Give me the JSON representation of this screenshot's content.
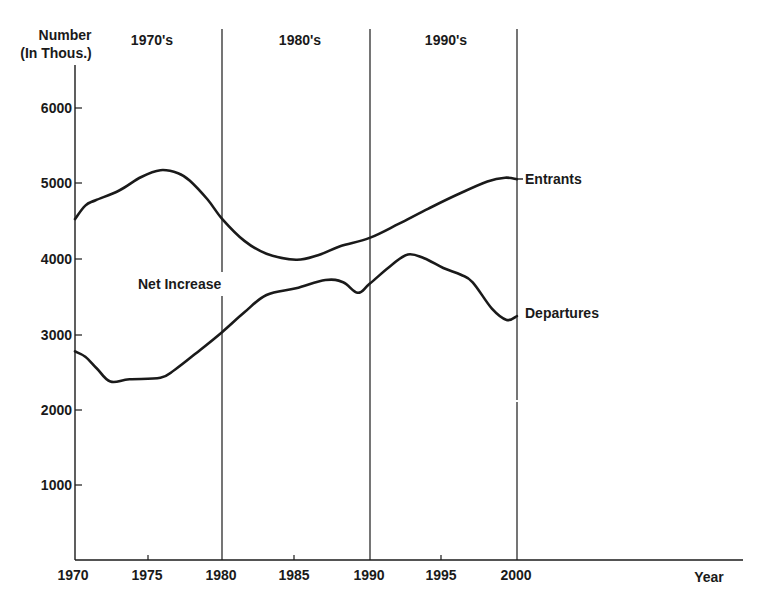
{
  "chart_data": {
    "type": "line",
    "title": "",
    "xlabel": "Year",
    "ylabel": "Number (In Thous.)",
    "ylabel_lines": [
      "Number",
      "(In Thous.)"
    ],
    "xlim": [
      1970,
      2000
    ],
    "ylim": [
      0,
      6000
    ],
    "x_ticks": [
      1970,
      1975,
      1980,
      1985,
      1990,
      1995,
      2000
    ],
    "y_ticks": [
      1000,
      2000,
      3000,
      4000,
      5000,
      6000
    ],
    "grid": false,
    "legend": "inline labels at right end of series",
    "decade_bands": [
      {
        "label": "1970's",
        "start": 1970,
        "end": 1980
      },
      {
        "label": "1980's",
        "start": 1980,
        "end": 1990
      },
      {
        "label": "1990's",
        "start": 1990,
        "end": 2000
      }
    ],
    "annotations": [
      {
        "text": "Net Increase",
        "x": 1977.5,
        "y": 3700,
        "note": "region between Entrants and Departures"
      }
    ],
    "series": [
      {
        "name": "Entrants",
        "x": [
          1970,
          1970.7,
          1971.4,
          1973,
          1974.5,
          1975.8,
          1977,
          1977.8,
          1979,
          1980,
          1981.5,
          1983,
          1985,
          1986.5,
          1988,
          1990,
          1992,
          1994,
          1996,
          1998,
          1999.2,
          2000
        ],
        "values": [
          4540,
          4720,
          4790,
          4920,
          5100,
          5190,
          5150,
          5050,
          4800,
          4540,
          4250,
          4080,
          4000,
          4060,
          4180,
          4290,
          4480,
          4680,
          4870,
          5040,
          5090,
          5070
        ]
      },
      {
        "name": "Departures",
        "x": [
          1970,
          1970.7,
          1971.5,
          1972.4,
          1973.7,
          1975.8,
          1976.8,
          1978.5,
          1980,
          1981.5,
          1983,
          1985,
          1987,
          1988.2,
          1989.2,
          1990,
          1991.5,
          1992.6,
          1993.7,
          1995,
          1996.2,
          1997,
          1998.3,
          1999.3,
          2000
        ],
        "values": [
          2780,
          2710,
          2550,
          2380,
          2410,
          2430,
          2540,
          2800,
          3040,
          3300,
          3530,
          3620,
          3730,
          3700,
          3560,
          3680,
          3930,
          4070,
          4020,
          3890,
          3800,
          3700,
          3350,
          3200,
          3250
        ]
      }
    ]
  },
  "labels": {
    "y_title_line1": "Number",
    "y_title_line2": "(In Thous.)",
    "x_title": "Year",
    "decade_1": "1970's",
    "decade_2": "1980's",
    "decade_3": "1990's",
    "net_increase": "Net Increase",
    "entrants": "Entrants",
    "departures": "Departures",
    "yt_1000": "1000",
    "yt_2000": "2000",
    "yt_3000": "3000",
    "yt_4000": "4000",
    "yt_5000": "5000",
    "yt_6000": "6000",
    "xt_1970": "1970",
    "xt_1975": "1975",
    "xt_1980": "1980",
    "xt_1985": "1985",
    "xt_1990": "1990",
    "xt_1995": "1995",
    "xt_2000": "2000"
  },
  "colors": {
    "ink": "#1a1a1a",
    "background": "#ffffff"
  }
}
